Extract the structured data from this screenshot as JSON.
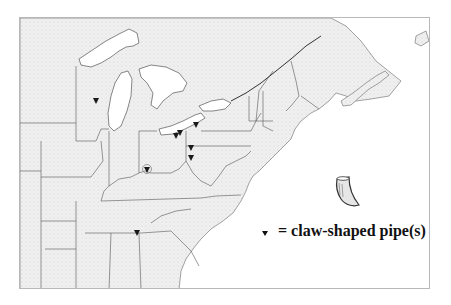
{
  "map": {
    "region": "Eastern North America",
    "legend": {
      "symbol": "inverted-triangle",
      "label": "= claw-shaped pipe(s)"
    },
    "illustration": "claw-shaped-pipe",
    "colors": {
      "land_fill": "#ececec",
      "water": "#ffffff",
      "borders": "#555555",
      "marker": "#1a1a1a"
    },
    "markers": [
      {
        "id": "wisconsin",
        "x": 95,
        "y": 99
      },
      {
        "id": "ohio-north-1",
        "x": 175,
        "y": 134
      },
      {
        "id": "ohio-north-2",
        "x": 178,
        "y": 131
      },
      {
        "id": "lake-erie-east",
        "x": 195,
        "y": 124
      },
      {
        "id": "ohio-east-1",
        "x": 190,
        "y": 146
      },
      {
        "id": "ohio-east-2",
        "x": 190,
        "y": 156
      },
      {
        "id": "ohio-southwest-circled",
        "x": 146,
        "y": 168
      },
      {
        "id": "tennessee-alabama",
        "x": 136,
        "y": 231
      }
    ]
  }
}
